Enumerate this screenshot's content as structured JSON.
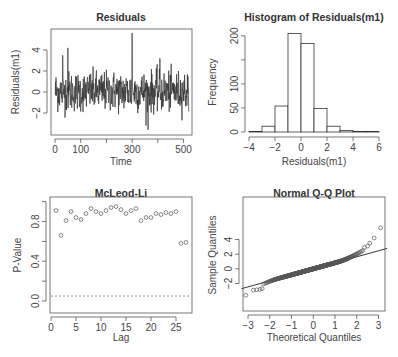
{
  "chart_data": [
    {
      "type": "line",
      "title": "Residuals",
      "xlabel": "Time",
      "ylabel": "Residuals(m1)",
      "xlim": [
        0,
        525
      ],
      "ylim": [
        -4,
        6
      ],
      "xticks": [
        0,
        100,
        200,
        300,
        400,
        500
      ],
      "xtick_labels": [
        "0",
        "100",
        "",
        "300",
        "",
        "500"
      ],
      "yticks": [
        -2,
        0,
        2,
        4
      ],
      "ytick_labels": [
        "-2",
        "0",
        "2",
        "4"
      ],
      "n": 520,
      "notable_points": [
        {
          "x": 300,
          "y": 5.6,
          "note": "max spike"
        },
        {
          "x": 362,
          "y": -3.6,
          "note": "min"
        },
        {
          "x": 50,
          "y": 4.2
        },
        {
          "x": 30,
          "y": 3.5
        },
        {
          "x": 408,
          "y": 3.2
        }
      ],
      "grid": false
    },
    {
      "type": "bar",
      "title": "Histogram of Residuals(m1)",
      "xlabel": "Residuals(m1)",
      "ylabel": "Frequency",
      "bin_edges": [
        -4,
        -3,
        -2,
        -1,
        0,
        1,
        2,
        3,
        4,
        5,
        6
      ],
      "categories": [
        "[-4,-3)",
        "[-3,-2)",
        "[-2,-1)",
        "[-1,0)",
        "[0,1)",
        "[1,2)",
        "[2,3)",
        "[3,4)",
        "[4,5)",
        "[5,6)"
      ],
      "values": [
        1,
        12,
        54,
        205,
        184,
        49,
        12,
        3,
        1,
        1
      ],
      "xticks": [
        -4,
        -2,
        0,
        2,
        4,
        6
      ],
      "yticks": [
        0,
        50,
        100,
        150,
        200
      ],
      "ytick_labels": [
        "0",
        "50",
        "100",
        "",
        "200"
      ],
      "ylim": [
        0,
        210
      ],
      "grid": false
    },
    {
      "type": "scatter",
      "title": "McLeod-Li",
      "xlabel": "Lag",
      "ylabel": "P-Value",
      "x": [
        1,
        2,
        3,
        4,
        5,
        6,
        7,
        8,
        9,
        10,
        11,
        12,
        13,
        14,
        15,
        16,
        17,
        18,
        19,
        20,
        21,
        22,
        23,
        24,
        25,
        26,
        27
      ],
      "values": [
        0.91,
        0.66,
        0.81,
        0.9,
        0.84,
        0.82,
        0.88,
        0.93,
        0.9,
        0.88,
        0.91,
        0.94,
        0.95,
        0.92,
        0.88,
        0.91,
        0.93,
        0.81,
        0.84,
        0.84,
        0.88,
        0.87,
        0.89,
        0.88,
        0.9,
        0.58,
        0.59
      ],
      "reference_line": {
        "y": 0.05,
        "style": "dashed"
      },
      "xticks": [
        0,
        5,
        10,
        15,
        20,
        25
      ],
      "yticks": [
        0.0,
        0.2,
        0.4,
        0.6,
        0.8,
        1.0
      ],
      "ytick_labels": [
        "0.0",
        "",
        "0.4",
        "",
        "0.8",
        ""
      ],
      "xlim": [
        0,
        28
      ],
      "ylim": [
        -0.04,
        1.0
      ],
      "grid": false
    },
    {
      "type": "scatter",
      "title": "Normal Q-Q Plot",
      "xlabel": "Theoretical Quantiles",
      "ylabel": "Sample Quantiles",
      "xticks": [
        -3,
        -2,
        -1,
        0,
        1,
        2,
        3
      ],
      "yticks": [
        -2,
        0,
        2,
        4
      ],
      "xlim": [
        -3.3,
        3.4
      ],
      "ylim": [
        -4,
        6
      ],
      "qq_line": {
        "intercept": 0.0,
        "slope": 0.82
      },
      "tail_points": [
        {
          "x": -3.1,
          "y": -3.6
        },
        {
          "x": -2.75,
          "y": -2.9
        },
        {
          "x": -2.6,
          "y": -2.85
        },
        {
          "x": -2.45,
          "y": -2.8
        },
        {
          "x": -2.35,
          "y": -2.7
        },
        {
          "x": 2.35,
          "y": 2.9
        },
        {
          "x": 2.5,
          "y": 3.1
        },
        {
          "x": 2.6,
          "y": 3.5
        },
        {
          "x": 2.8,
          "y": 4.2
        },
        {
          "x": 3.1,
          "y": 5.6
        }
      ],
      "grid": false
    }
  ]
}
